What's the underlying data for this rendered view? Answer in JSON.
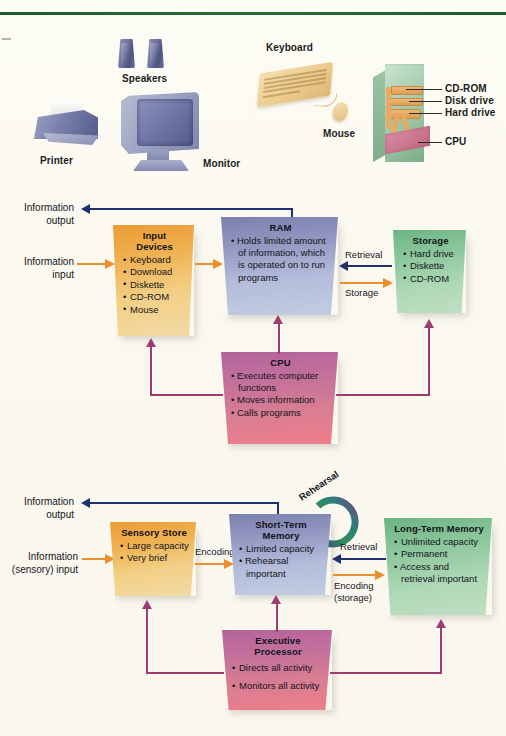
{
  "figure": {
    "hardware_panel": {
      "labels": [
        {
          "name": "speakers",
          "text": "Speakers"
        },
        {
          "name": "printer",
          "text": "Printer"
        },
        {
          "name": "monitor",
          "text": "Monitor"
        },
        {
          "name": "keyboard",
          "text": "Keyboard"
        },
        {
          "name": "mouse",
          "text": "Mouse"
        },
        {
          "name": "cd-rom",
          "text": "CD-ROM"
        },
        {
          "name": "disk-drive",
          "text": "Disk drive"
        },
        {
          "name": "hard-drive",
          "text": "Hard drive"
        },
        {
          "name": "cpu",
          "text": "CPU"
        }
      ]
    },
    "computer_diagram": {
      "side_labels": {
        "output": "Information\noutput",
        "output_line1": "Information",
        "output_line2": "output",
        "input_line1": "Information",
        "input_line2": "input"
      },
      "arrow_labels": {
        "retrieval": "Retrieval",
        "storage": "Storage"
      },
      "boxes": [
        {
          "name": "input-devices",
          "title": "Input Devices",
          "items": [
            "Keyboard",
            "Download",
            "Diskette",
            "CD-ROM",
            "Mouse"
          ],
          "color": "#eb9b34"
        },
        {
          "name": "ram",
          "title": "RAM",
          "items": [
            "Holds limited amount of information, which is operated on to run programs"
          ],
          "color": "#7b7fae"
        },
        {
          "name": "storage",
          "title": "Storage",
          "items": [
            "Hard drive",
            "Diskette",
            "CD-ROM"
          ],
          "color": "#6cb484"
        },
        {
          "name": "cpu",
          "title": "CPU",
          "items": [
            "Executes computer functions",
            "Moves information",
            "Calls programs"
          ],
          "color": "#b4639b"
        }
      ]
    },
    "memory_diagram": {
      "side_labels": {
        "output_line1": "Information",
        "output_line2": "output",
        "input_line1": "Information",
        "input_line2": "(sensory) input"
      },
      "arrow_labels": {
        "encoding": "Encoding",
        "retrieval": "Retrieval",
        "encoding_storage_line1": "Encoding",
        "encoding_storage_line2": "(storage)",
        "rehearsal": "Rehearsal"
      },
      "boxes": [
        {
          "name": "sensory-store",
          "title": "Sensory Store",
          "items": [
            "Large capacity",
            "Very brief"
          ],
          "color": "#eb9b34"
        },
        {
          "name": "short-term-memory",
          "title": "Short-Term Memory",
          "items": [
            "Limited capacity",
            "Rehearsal important"
          ],
          "color": "#7b7fae"
        },
        {
          "name": "long-term-memory",
          "title": "Long-Term Memory",
          "items": [
            "Unlimited capacity",
            "Permanent",
            "Access and retrieval important"
          ],
          "color": "#6cb484"
        },
        {
          "name": "executive-processor",
          "title": "Executive Processor",
          "items": [
            "Directs all activity",
            "Monitors all activity"
          ],
          "color": "#b4639b"
        }
      ]
    },
    "colors": {
      "page_background": "#fbfaf2",
      "top_rule": "#1e5b2c",
      "navy_arrow": "#22306e",
      "orange_arrow": "#e98f2c",
      "purple_arrow": "#a03b72"
    }
  }
}
